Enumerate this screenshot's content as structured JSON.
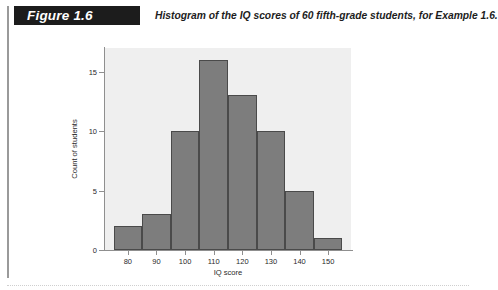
{
  "figure": {
    "tag": "Figure 1.6",
    "caption": "Histogram of the IQ scores of 60 fifth-grade students, for Example 1.6."
  },
  "chart_data": {
    "type": "bar",
    "title": "",
    "subtitle": "",
    "xlabel": "IQ score",
    "ylabel": "Count of students",
    "categories": [
      "75-85",
      "85-95",
      "95-105",
      "105-115",
      "115-125",
      "125-135",
      "135-145",
      "145-155"
    ],
    "bin_edges": [
      75,
      85,
      95,
      105,
      115,
      125,
      135,
      145,
      155
    ],
    "values": [
      2,
      3,
      10,
      16,
      13,
      10,
      5,
      1
    ],
    "total_count": 60,
    "xlim": [
      72,
      158
    ],
    "ylim": [
      0,
      17
    ],
    "xticks": [
      80,
      90,
      100,
      110,
      120,
      130,
      140,
      150
    ],
    "xtick_labels": [
      "80",
      "90",
      "100",
      "110",
      "120",
      "130",
      "140",
      "150"
    ],
    "yticks": [
      0,
      5,
      10,
      15
    ],
    "ytick_labels": [
      "0",
      "5",
      "10",
      "15"
    ],
    "grid": false,
    "legend": "none",
    "bar_fill": "#7d7d7d",
    "bar_stroke": "#4a4a4a",
    "plot_background": "#efefef"
  }
}
